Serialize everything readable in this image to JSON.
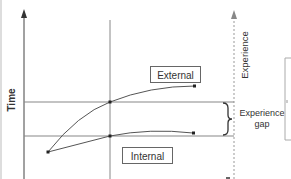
{
  "diagram": {
    "y_axis_label": "Time",
    "right_axis_label": "Experience",
    "curves": [
      {
        "name": "External",
        "label": "External"
      },
      {
        "name": "Internal",
        "label": "Internal"
      }
    ],
    "gap_label_line1": "Experience",
    "gap_label_line2": "gap",
    "colors": {
      "line": "#555555",
      "axis": "#444444",
      "dashed_axis": "#999999",
      "grid": "#888888",
      "text": "#333333"
    }
  }
}
